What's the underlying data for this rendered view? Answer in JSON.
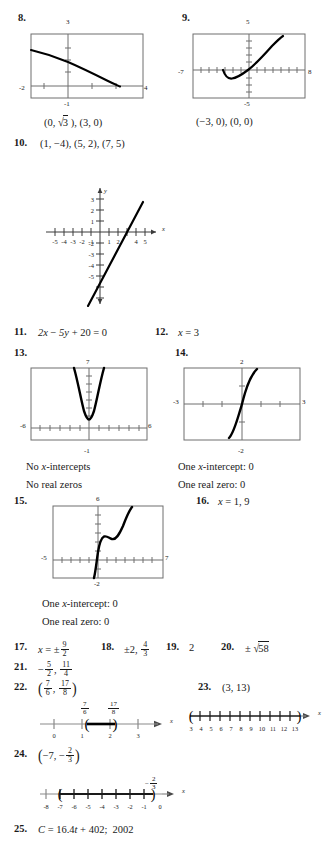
{
  "page": {
    "background": "#ffffff",
    "ink": "#1a1a1a",
    "axis_color": "#6e6e6e",
    "curve_color": "#000000"
  },
  "items": [
    {
      "number": "8.",
      "type": "graph-with-answer",
      "answer": "(0, √3), (3, 0)",
      "graph": {
        "kind": "calculator-window",
        "xmin": "-2",
        "xmax": "4",
        "ymin": "-1",
        "ymax": "3",
        "left_label": "-2",
        "right_label": "4",
        "top_label": "3",
        "bottom_label": "-1",
        "curve": "decreasing radical, y = sqrt(3-x) type"
      }
    },
    {
      "number": "9.",
      "type": "graph-with-answer",
      "answer": "(−3, 0), (0, 0)",
      "graph": {
        "kind": "calculator-window",
        "xmin": "-7",
        "xmax": "8",
        "ymin": "-5",
        "ymax": "5",
        "left_label": "-7",
        "right_label": "8",
        "top_label": "5",
        "bottom_label": "-5",
        "curve": "cubic-like rising through origin with local min near x=-2"
      }
    },
    {
      "number": "10.",
      "type": "answer-then-graph",
      "answer": "(1, −4), (5, 2), (7, 5)",
      "graph": {
        "kind": "cartesian-plane",
        "x_ticks": [
          "-5",
          "-4",
          "-3",
          "-2",
          "-1",
          "1",
          "2",
          "4",
          "5"
        ],
        "y_ticks": [
          "3",
          "2",
          "1",
          "-2",
          "-3",
          "-4",
          "-5"
        ],
        "x_axis_label": "x",
        "y_axis_label": "y",
        "line": "steep increasing line crossing x-axis near 3.7"
      }
    },
    {
      "number": "11.",
      "type": "text",
      "answer": "2x − 5y + 20 = 0"
    },
    {
      "number": "12.",
      "type": "text",
      "answer": "x = 3"
    },
    {
      "number": "13.",
      "type": "graph-with-answer",
      "answer_lines": [
        "No x-intercepts",
        "No real zeros"
      ],
      "graph": {
        "kind": "calculator-window",
        "xmin": "-6",
        "xmax": "6",
        "ymin": "-1",
        "ymax": "7",
        "left_label": "-6",
        "right_label": "6",
        "top_label": "7",
        "bottom_label": "-1",
        "curve": "narrow upward parabola with vertex above x-axis"
      }
    },
    {
      "number": "14.",
      "type": "graph-with-answer",
      "answer_lines": [
        "One x-intercept: 0",
        "One real zero: 0"
      ],
      "graph": {
        "kind": "calculator-window",
        "xmin": "-3",
        "xmax": "3",
        "ymin": "-2",
        "ymax": "2",
        "left_label": "-3",
        "right_label": "3",
        "top_label": "2",
        "bottom_label": "-2",
        "curve": "odd cubic through origin"
      }
    },
    {
      "number": "15.",
      "type": "graph-with-answer",
      "answer_lines": [
        "One x-intercept: 0",
        "One real zero: 0"
      ],
      "graph": {
        "kind": "calculator-window",
        "xmin": "-5",
        "xmax": "7",
        "ymin": "-2",
        "ymax": "6",
        "left_label": "-5",
        "right_label": "7",
        "top_label": "6",
        "bottom_label": "-2",
        "curve": "cubic with flat inflection shelf"
      }
    },
    {
      "number": "16.",
      "type": "text",
      "answer": "x = 1, 9"
    },
    {
      "number": "17.",
      "type": "fraction",
      "prefix": "x = ±",
      "num": "9",
      "den": "2"
    },
    {
      "number": "18.",
      "type": "fraction",
      "prefix": "±2, ",
      "num": "4",
      "den": "3"
    },
    {
      "number": "19.",
      "type": "text",
      "answer": "2"
    },
    {
      "number": "20.",
      "type": "radical",
      "prefix": "±",
      "radicand": "58"
    },
    {
      "number": "21.",
      "type": "two-fractions",
      "n1": "5",
      "d1": "2",
      "n2": "11",
      "d2": "4",
      "sign": "−",
      "sep": ", "
    },
    {
      "number": "22.",
      "type": "interval-with-numberline",
      "interval_open_left": "(",
      "interval_open_right": ")",
      "f1_num": "7",
      "f1_den": "6",
      "f2_num": "17",
      "f2_den": "8",
      "numberline": {
        "ticks": [
          "0",
          "1",
          "2",
          "3"
        ],
        "axis_label": "x",
        "mark_left_label_num": "7",
        "mark_left_label_den": "6",
        "mark_right_label_num": "17",
        "mark_right_label_den": "8",
        "endpoint_style": "open-parentheses"
      }
    },
    {
      "number": "23.",
      "type": "interval-with-numberline",
      "answer": "(3, 13)",
      "numberline": {
        "ticks": [
          "3",
          "4",
          "5",
          "6",
          "7",
          "8",
          "9",
          "10",
          "11",
          "12",
          "13"
        ],
        "axis_label": "x",
        "endpoint_style": "open-parentheses"
      }
    },
    {
      "number": "24.",
      "type": "interval-with-numberline",
      "answer_parts": {
        "left": "−7,",
        "frac_sign": "−",
        "frac_num": "2",
        "frac_den": "3"
      },
      "numberline": {
        "ticks": [
          "-8",
          "-7",
          "-6",
          "-5",
          "-4",
          "-3",
          "-2",
          "-1",
          "0"
        ],
        "axis_label": "x",
        "top_label_sign": "−",
        "top_label_num": "2",
        "top_label_den": "3",
        "endpoint_style": "open-parentheses"
      }
    },
    {
      "number": "25.",
      "type": "text",
      "answer": "C = 16.4t + 402;  2002"
    }
  ],
  "labels": {
    "no_x_intercepts": "No x-intercepts",
    "no_real_zeros": "No real zeros",
    "one_x_intercept": "One x-intercept: 0",
    "one_real_zero": "One real zero: 0",
    "x_axis": "x",
    "y_axis": "y"
  }
}
